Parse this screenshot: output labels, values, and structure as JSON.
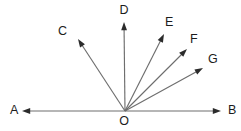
{
  "figure": {
    "name": "rays-from-common-vertex",
    "width": 241,
    "height": 131,
    "background_color": "#ffffff",
    "line_color": "#6e6e6e",
    "arrowhead_color": "#2b2b2b",
    "label_color": "#1c1c1c"
  },
  "vertex": {
    "label": "O",
    "x": 125,
    "y": 111,
    "label_x": 124,
    "label_y": 122
  },
  "rays": [
    {
      "label": "A",
      "name": "ray-oa",
      "from_x": 125,
      "from_y": 111,
      "to_x": 22,
      "to_y": 111,
      "label_x": 10,
      "label_y": 111,
      "label_anchor": "start",
      "direction": "left-horizontal",
      "angle_deg": 180
    },
    {
      "label": "B",
      "name": "ray-ob",
      "from_x": 125,
      "from_y": 111,
      "to_x": 221,
      "to_y": 111,
      "label_x": 228,
      "label_y": 111,
      "label_anchor": "start",
      "direction": "right-horizontal",
      "angle_deg": 0
    },
    {
      "label": "C",
      "name": "ray-oc",
      "from_x": 125,
      "from_y": 111,
      "to_x": 78,
      "to_y": 39,
      "label_x": 58,
      "label_y": 32,
      "label_anchor": "start",
      "direction": "upper-left",
      "angle_deg": 123
    },
    {
      "label": "D",
      "name": "ray-od",
      "from_x": 125,
      "from_y": 111,
      "to_x": 124,
      "to_y": 22,
      "label_x": 124,
      "label_y": 11,
      "label_anchor": "middle",
      "direction": "vertical-up",
      "angle_deg": 90
    },
    {
      "label": "E",
      "name": "ray-oe",
      "from_x": 125,
      "from_y": 111,
      "to_x": 164,
      "to_y": 34,
      "label_x": 165,
      "label_y": 23,
      "label_anchor": "start",
      "direction": "upper-right-steep",
      "angle_deg": 63
    },
    {
      "label": "F",
      "name": "ray-of",
      "from_x": 125,
      "from_y": 111,
      "to_x": 187,
      "to_y": 49,
      "label_x": 190,
      "label_y": 40,
      "label_anchor": "start",
      "direction": "upper-right-medium",
      "angle_deg": 45
    },
    {
      "label": "G",
      "name": "ray-og",
      "from_x": 125,
      "from_y": 111,
      "to_x": 203,
      "to_y": 68,
      "label_x": 208,
      "label_y": 60,
      "label_anchor": "start",
      "direction": "upper-right-shallow",
      "angle_deg": 29
    }
  ]
}
